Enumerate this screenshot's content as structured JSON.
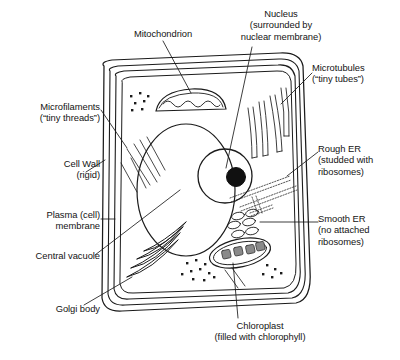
{
  "diagram": {
    "type": "labeled-biological-diagram",
    "background_color": "#ffffff",
    "stroke_color": "#1b1b1b",
    "granum_fill": "#8a8a8a"
  },
  "labels": [
    {
      "id": "mitochondrion",
      "name": "Mitochondrion",
      "text": "Mitochondrion",
      "align": "center",
      "x": 113,
      "y": 28,
      "w": 100
    },
    {
      "id": "nucleus",
      "name": "Nucleus",
      "text": "Nucleus\n(surrounded by\nnuclear membrane)",
      "align": "center",
      "x": 222,
      "y": 8,
      "w": 118
    },
    {
      "id": "microtubules",
      "name": "Microtubules",
      "text": "Microtubules\n(“tiny tubes”)",
      "align": "left",
      "x": 312,
      "y": 62,
      "w": 86
    },
    {
      "id": "microfilaments",
      "name": "Microfilaments",
      "text": "Microfilaments\n(“tiny threads”)",
      "align": "right",
      "x": 8,
      "y": 101,
      "w": 92
    },
    {
      "id": "cell-wall",
      "name": "Cell Wall",
      "text": "Cell Wall\n(rigid)",
      "align": "right",
      "x": 16,
      "y": 158,
      "w": 84
    },
    {
      "id": "rough-er",
      "name": "Rough ER",
      "text": "Rough ER\n(studded with\nribosomes)",
      "align": "left",
      "x": 318,
      "y": 143,
      "w": 82
    },
    {
      "id": "plasma-membrane",
      "name": "Plasma membrane",
      "text": "Plasma (cell)\nmembrane",
      "align": "right",
      "x": 8,
      "y": 209,
      "w": 92
    },
    {
      "id": "smooth-er",
      "name": "Smooth ER",
      "text": "Smooth ER\n(no attached\nribosomes)",
      "align": "left",
      "x": 318,
      "y": 213,
      "w": 82
    },
    {
      "id": "central-vacuole",
      "name": "Central vacuole",
      "text": "Central vacuole",
      "align": "right",
      "x": 4,
      "y": 250,
      "w": 96
    },
    {
      "id": "golgi-body",
      "name": "Golgi body",
      "text": "Golgi body",
      "align": "right",
      "x": 16,
      "y": 303,
      "w": 84
    },
    {
      "id": "chloroplast",
      "name": "Chloroplast",
      "text": "Chloroplast\n(filled with chlorophyll)",
      "align": "center",
      "x": 176,
      "y": 320,
      "w": 168
    }
  ],
  "leader_lines": [
    {
      "id": "leader-mitochondrion",
      "points": "163,41 191,93"
    },
    {
      "id": "leader-nucleus",
      "points": "252,47 226,168"
    },
    {
      "id": "leader-microtubules",
      "points": "312,73 281,104"
    },
    {
      "id": "leader-microfilaments",
      "points": "101,110 127,148"
    },
    {
      "id": "leader-cell-wall",
      "points": "86,172 105,160"
    },
    {
      "id": "leader-rough-er",
      "points": "318,152 287,176"
    },
    {
      "id": "leader-plasma-membrane",
      "points": "101,219 115,219"
    },
    {
      "id": "leader-smooth-er",
      "points": "318,222 260,222"
    },
    {
      "id": "leader-central-vacuole",
      "points": "95,255 180,190"
    },
    {
      "id": "leader-golgi-body",
      "points": "84,305 132,277"
    },
    {
      "id": "leader-chloroplast",
      "points": "238,318 233,263"
    }
  ],
  "structures": {
    "cell_wall_outer": {
      "name": "cell-wall-outer-boundary",
      "description": "rounded rectangle outer cell wall"
    },
    "cell_wall_inner": {
      "name": "cell-wall-inner-boundary",
      "description": "rounded rectangle inner cell wall"
    },
    "plasma_membrane": {
      "name": "plasma-membrane-boundary",
      "description": "innermost rounded rectangle membrane"
    },
    "central_vacuole": {
      "name": "central-vacuole",
      "description": "large ellipse occupying cell centre"
    },
    "nucleus": {
      "name": "nucleus",
      "description": "circle with dark nucleolus"
    },
    "nucleolus": {
      "name": "nucleolus",
      "description": "filled black circle inside nucleus"
    },
    "mitochondrion": {
      "name": "mitochondrion",
      "description": "dome shape with wavy internal cristae"
    },
    "chloroplast": {
      "name": "chloroplast",
      "description": "tilted double-outlined ellipse with four grana"
    },
    "golgi_body": {
      "name": "golgi-body",
      "description": "stack of nested curved cisternae"
    },
    "microtubules": {
      "name": "microtubules",
      "description": "four hollow curved tubes"
    },
    "microfilaments": {
      "name": "microfilaments",
      "description": "group of thin diagonal threads"
    },
    "rough_er": {
      "name": "rough-endoplasmic-reticulum",
      "description": "dotted ribosome-studded channels"
    },
    "smooth_er": {
      "name": "smooth-endoplasmic-reticulum",
      "description": "cluster of small open ovals"
    },
    "ribosomes": {
      "name": "free-ribosomes",
      "description": "scattered small dots in cytoplasm"
    },
    "grana_count": 4
  }
}
